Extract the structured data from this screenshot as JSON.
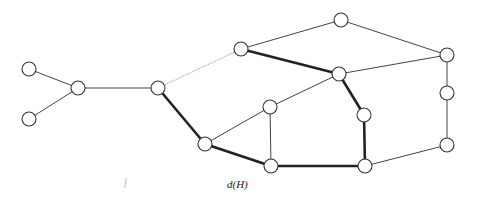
{
  "diagram": {
    "caption": "d(H)",
    "colors": {
      "node_stroke": "#333333",
      "node_fill": "#ffffff",
      "thin_edge": "#444444",
      "thick_edge": "#222222",
      "faint_edge": "#999999"
    },
    "nodes": [
      {
        "id": "A",
        "x": 29,
        "y": 69
      },
      {
        "id": "B",
        "x": 29,
        "y": 119
      },
      {
        "id": "C",
        "x": 78,
        "y": 88
      },
      {
        "id": "D",
        "x": 158,
        "y": 88
      },
      {
        "id": "E",
        "x": 241,
        "y": 49
      },
      {
        "id": "F",
        "x": 341,
        "y": 20
      },
      {
        "id": "G",
        "x": 205,
        "y": 144
      },
      {
        "id": "H",
        "x": 270,
        "y": 107
      },
      {
        "id": "I",
        "x": 339,
        "y": 74
      },
      {
        "id": "J",
        "x": 447,
        "y": 55
      },
      {
        "id": "K",
        "x": 447,
        "y": 93
      },
      {
        "id": "L",
        "x": 364,
        "y": 115
      },
      {
        "id": "M",
        "x": 271,
        "y": 166
      },
      {
        "id": "N",
        "x": 365,
        "y": 166
      },
      {
        "id": "O",
        "x": 447,
        "y": 145
      }
    ],
    "edges": [
      {
        "from": "A",
        "to": "C",
        "style": "thin"
      },
      {
        "from": "B",
        "to": "C",
        "style": "thin"
      },
      {
        "from": "C",
        "to": "D",
        "style": "thin"
      },
      {
        "from": "D",
        "to": "E",
        "style": "faint"
      },
      {
        "from": "D",
        "to": "G",
        "style": "thick"
      },
      {
        "from": "G",
        "to": "H",
        "style": "thin"
      },
      {
        "from": "G",
        "to": "M",
        "style": "thick"
      },
      {
        "from": "H",
        "to": "I",
        "style": "thin"
      },
      {
        "from": "H",
        "to": "M",
        "style": "thin"
      },
      {
        "from": "E",
        "to": "F",
        "style": "thin"
      },
      {
        "from": "E",
        "to": "I",
        "style": "thick"
      },
      {
        "from": "F",
        "to": "J",
        "style": "thin"
      },
      {
        "from": "I",
        "to": "J",
        "style": "thin"
      },
      {
        "from": "I",
        "to": "L",
        "style": "thick"
      },
      {
        "from": "L",
        "to": "N",
        "style": "thick"
      },
      {
        "from": "M",
        "to": "N",
        "style": "thick"
      },
      {
        "from": "N",
        "to": "O",
        "style": "thin"
      },
      {
        "from": "J",
        "to": "K",
        "style": "thin"
      },
      {
        "from": "K",
        "to": "O",
        "style": "thin"
      }
    ]
  }
}
